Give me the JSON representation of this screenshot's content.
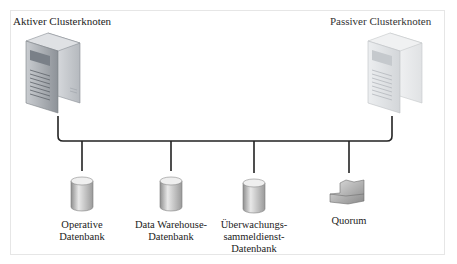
{
  "diagram": {
    "active_node": {
      "title": "Aktiver Clusterknoten",
      "icon": "server-icon"
    },
    "passive_node": {
      "title": "Passiver Clusterknoten",
      "icon": "server-icon-faded"
    },
    "resources": [
      {
        "label_lines": [
          "Operative",
          "Datenbank"
        ],
        "icon": "database-icon"
      },
      {
        "label_lines": [
          "Data Warehouse-",
          "Datenbank"
        ],
        "icon": "database-icon"
      },
      {
        "label_lines": [
          "Überwachungs-",
          "sammeldienst-",
          "Datenbank"
        ],
        "icon": "database-icon"
      },
      {
        "label_lines": [
          "Quorum"
        ],
        "icon": "quorum-disk-icon"
      }
    ],
    "colors": {
      "line": "#222222",
      "frame": "#e6e6e6",
      "server": "#9aa0a6",
      "db": "#b8b8b8"
    }
  }
}
